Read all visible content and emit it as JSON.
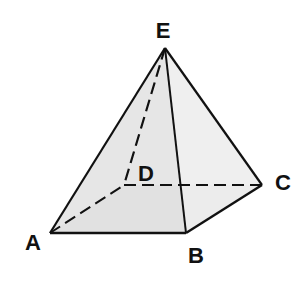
{
  "diagram": {
    "type": "square-pyramid",
    "vertices": {
      "A": {
        "label": "A",
        "x": 50,
        "y": 233,
        "label_x": 33,
        "label_y": 250
      },
      "B": {
        "label": "B",
        "x": 186,
        "y": 233,
        "label_x": 196,
        "label_y": 263
      },
      "C": {
        "label": "C",
        "x": 262,
        "y": 185,
        "label_x": 283,
        "label_y": 190
      },
      "D": {
        "label": "D",
        "x": 124,
        "y": 185,
        "label_x": 146,
        "label_y": 181
      },
      "E": {
        "label": "E",
        "x": 165,
        "y": 48,
        "label_x": 163,
        "label_y": 38
      }
    },
    "visible_edges": [
      [
        "E",
        "A"
      ],
      [
        "E",
        "B"
      ],
      [
        "E",
        "C"
      ],
      [
        "A",
        "B"
      ],
      [
        "B",
        "C"
      ]
    ],
    "hidden_edges": [
      [
        "E",
        "D"
      ],
      [
        "A",
        "D"
      ],
      [
        "D",
        "C"
      ]
    ],
    "faces": {
      "left_front": {
        "vertices": [
          "E",
          "A",
          "B"
        ],
        "color": "#e2e2e2"
      },
      "right_front": {
        "vertices": [
          "E",
          "B",
          "C"
        ],
        "color": "#ededed"
      },
      "base": {
        "vertices": [
          "A",
          "B",
          "C",
          "D"
        ],
        "color": "#d9d9d9"
      }
    },
    "colors": {
      "edge": "#111111",
      "label": "#111111",
      "background": "#ffffff"
    }
  }
}
